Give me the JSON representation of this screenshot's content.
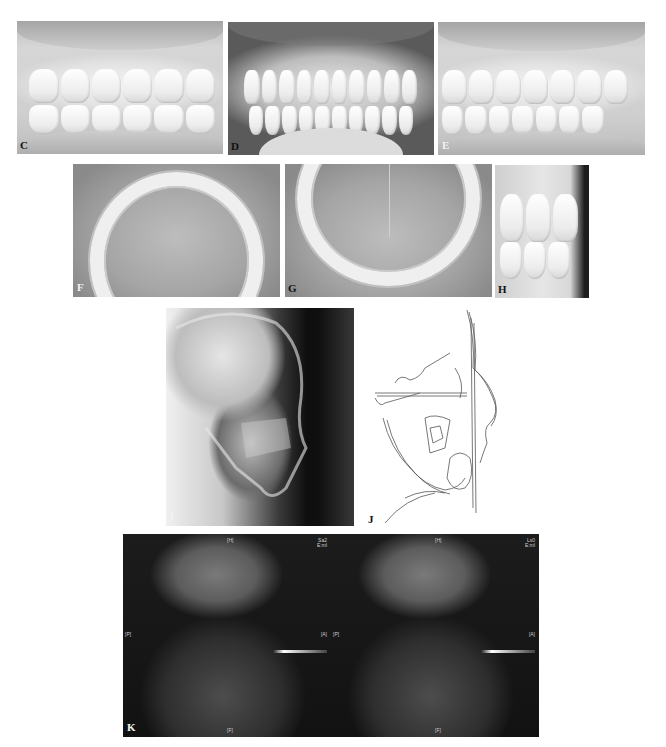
{
  "figure": {
    "panels": [
      {
        "id": "C",
        "label": "C",
        "type": "intraoral-right-lateral-photo"
      },
      {
        "id": "D",
        "label": "D",
        "type": "intraoral-frontal-photo"
      },
      {
        "id": "E",
        "label": "E",
        "type": "intraoral-left-lateral-photo"
      },
      {
        "id": "F",
        "label": "F",
        "type": "maxillary-occlusal-photo"
      },
      {
        "id": "G",
        "label": "G",
        "type": "mandibular-occlusal-photo"
      },
      {
        "id": "H",
        "label": "H",
        "type": "intraoral-overjet-photo"
      },
      {
        "id": "I",
        "label": "I",
        "type": "lateral-cephalogram"
      },
      {
        "id": "J",
        "label": "J",
        "type": "cephalometric-tracing"
      },
      {
        "id": "K",
        "label": "K",
        "type": "tmj-mri"
      }
    ],
    "mri_markers": {
      "left": {
        "top": "[H]",
        "left": "[P]",
        "right": "[A]",
        "bottom": "[F]",
        "corner": "Sa2\nE:ml"
      },
      "right": {
        "top": "[H]",
        "left": "[P]",
        "right": "[A]",
        "bottom": "[F]",
        "corner": "Ls0\nE:ml"
      }
    }
  }
}
